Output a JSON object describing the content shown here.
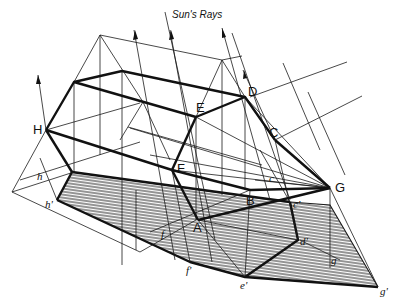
{
  "diagram": {
    "title": "Sun's Rays",
    "colors": {
      "ink": "#111111",
      "paper": "#ffffff",
      "hatch": "#2a2a2a"
    },
    "points": {
      "upper": [
        {
          "id": "H",
          "label": "H"
        },
        {
          "id": "E",
          "label": "E"
        },
        {
          "id": "D",
          "label": "D"
        },
        {
          "id": "C",
          "label": "C"
        },
        {
          "id": "G",
          "label": "G"
        },
        {
          "id": "F",
          "label": "F"
        },
        {
          "id": "B",
          "label": "B"
        },
        {
          "id": "A",
          "label": "A"
        }
      ],
      "lower": [
        {
          "id": "h",
          "label": "h"
        },
        {
          "id": "h_prime",
          "label": "h'"
        },
        {
          "id": "c",
          "label": "c"
        },
        {
          "id": "c_prime",
          "label": "c'"
        },
        {
          "id": "d_prime",
          "label": "d'"
        },
        {
          "id": "f",
          "label": "f"
        },
        {
          "id": "f_prime",
          "label": "f'"
        },
        {
          "id": "e_prime",
          "label": "e'"
        },
        {
          "id": "g",
          "label": "g"
        },
        {
          "id": "g_prime",
          "label": "g'"
        }
      ]
    },
    "regions": {
      "shadow": "hatched-shadow-region",
      "solid": "hexagonal-prism-solid"
    }
  }
}
